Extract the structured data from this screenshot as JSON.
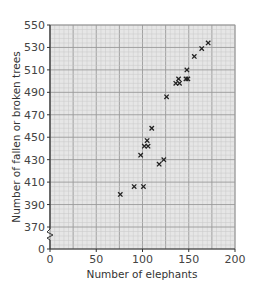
{
  "chart_data": {
    "type": "scatter",
    "title": "",
    "xlabel": "Number of elephants",
    "ylabel": "Number of fallen or broken trees",
    "xlim": [
      0,
      200
    ],
    "ylim": [
      370,
      550
    ],
    "y_axis_break": {
      "from": 0,
      "to": 370
    },
    "grid": true,
    "legend": null,
    "x_ticks": [
      0,
      50,
      100,
      150,
      200
    ],
    "y_ticks": [
      0,
      370,
      390,
      410,
      430,
      450,
      470,
      490,
      510,
      530,
      550
    ],
    "marker": "x",
    "points": [
      {
        "x": 76,
        "y": 399
      },
      {
        "x": 91,
        "y": 406
      },
      {
        "x": 101,
        "y": 406
      },
      {
        "x": 98,
        "y": 434
      },
      {
        "x": 102,
        "y": 442
      },
      {
        "x": 105,
        "y": 447
      },
      {
        "x": 106,
        "y": 442
      },
      {
        "x": 110,
        "y": 458
      },
      {
        "x": 118,
        "y": 426
      },
      {
        "x": 123,
        "y": 430
      },
      {
        "x": 126,
        "y": 486
      },
      {
        "x": 136,
        "y": 498
      },
      {
        "x": 139,
        "y": 502
      },
      {
        "x": 140,
        "y": 498
      },
      {
        "x": 147,
        "y": 502
      },
      {
        "x": 149,
        "y": 502
      },
      {
        "x": 148,
        "y": 510
      },
      {
        "x": 156,
        "y": 522
      },
      {
        "x": 164,
        "y": 529
      },
      {
        "x": 171,
        "y": 534
      }
    ]
  },
  "colors": {
    "grid_minor": "#c8c8c8",
    "grid_major": "#9a9a9a",
    "plot_bg": "#e6e6e6",
    "axis": "#333333",
    "marker": "#222222"
  }
}
